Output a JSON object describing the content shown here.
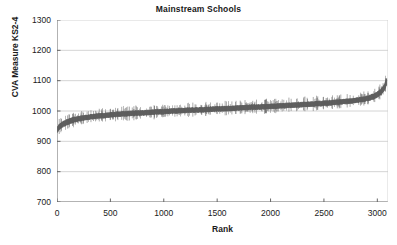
{
  "chart_data": {
    "type": "line",
    "title": "Mainstream Schools",
    "xlabel": "Rank",
    "ylabel": "CVA Measure KS2-4",
    "xlim": [
      0,
      3100
    ],
    "ylim": [
      700,
      1300
    ],
    "xticks": [
      0,
      500,
      1000,
      1500,
      2000,
      2500,
      3000
    ],
    "yticks": [
      700,
      800,
      900,
      1000,
      1100,
      1200,
      1300
    ],
    "xtick_labels": [
      "0",
      "500",
      "1000",
      "1500",
      "2000",
      "2500",
      "3000"
    ],
    "ytick_labels": [
      "700",
      "800",
      "900",
      "1000",
      "1100",
      "1200",
      "1300"
    ],
    "grid": "horizontal",
    "legend": "none",
    "series_color": "#5e5e5e",
    "grid_color": "#c9c9c9",
    "axis_color": "#666666",
    "x": [
      0,
      25,
      50,
      75,
      100,
      150,
      200,
      250,
      300,
      400,
      500,
      600,
      700,
      800,
      900,
      1000,
      1100,
      1200,
      1300,
      1400,
      1500,
      1600,
      1700,
      1800,
      1900,
      2000,
      2100,
      2200,
      2300,
      2400,
      2500,
      2600,
      2700,
      2800,
      2900,
      2950,
      3000,
      3030,
      3060,
      3080,
      3090
    ],
    "values": [
      938,
      948,
      955,
      960,
      964,
      970,
      974,
      977,
      980,
      984,
      987,
      990,
      992,
      994,
      996,
      998,
      1000,
      1002,
      1003,
      1005,
      1007,
      1008,
      1010,
      1012,
      1013,
      1015,
      1017,
      1019,
      1021,
      1023,
      1025,
      1028,
      1031,
      1035,
      1041,
      1046,
      1054,
      1062,
      1074,
      1090,
      1100
    ],
    "ci_halfwidth": [
      9,
      9,
      9,
      9,
      9,
      9,
      8,
      8,
      8,
      8,
      8,
      8,
      8,
      8,
      8,
      8,
      8,
      8,
      8,
      8,
      8,
      8,
      8,
      8,
      8,
      8,
      8,
      8,
      8,
      8,
      8,
      8,
      8,
      8,
      8,
      9,
      9,
      9,
      10,
      11,
      12
    ],
    "whisker_extra": 14,
    "n_points": 3090
  }
}
